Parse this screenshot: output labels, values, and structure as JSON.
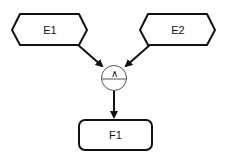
{
  "diagram": {
    "nodes": [
      {
        "id": "E1",
        "label": "E1",
        "shape": "hexagon"
      },
      {
        "id": "E2",
        "label": "E2",
        "shape": "hexagon"
      },
      {
        "id": "gate",
        "label": "∧",
        "shape": "and-gate-circle"
      },
      {
        "id": "F1",
        "label": "F1",
        "shape": "rounded-rectangle"
      }
    ],
    "edges": [
      {
        "from": "E1",
        "to": "gate"
      },
      {
        "from": "E2",
        "to": "gate"
      },
      {
        "from": "gate",
        "to": "F1"
      }
    ]
  },
  "colors": {
    "stroke": "#111111",
    "gate_stroke": "#555555",
    "background": "#ffffff"
  }
}
